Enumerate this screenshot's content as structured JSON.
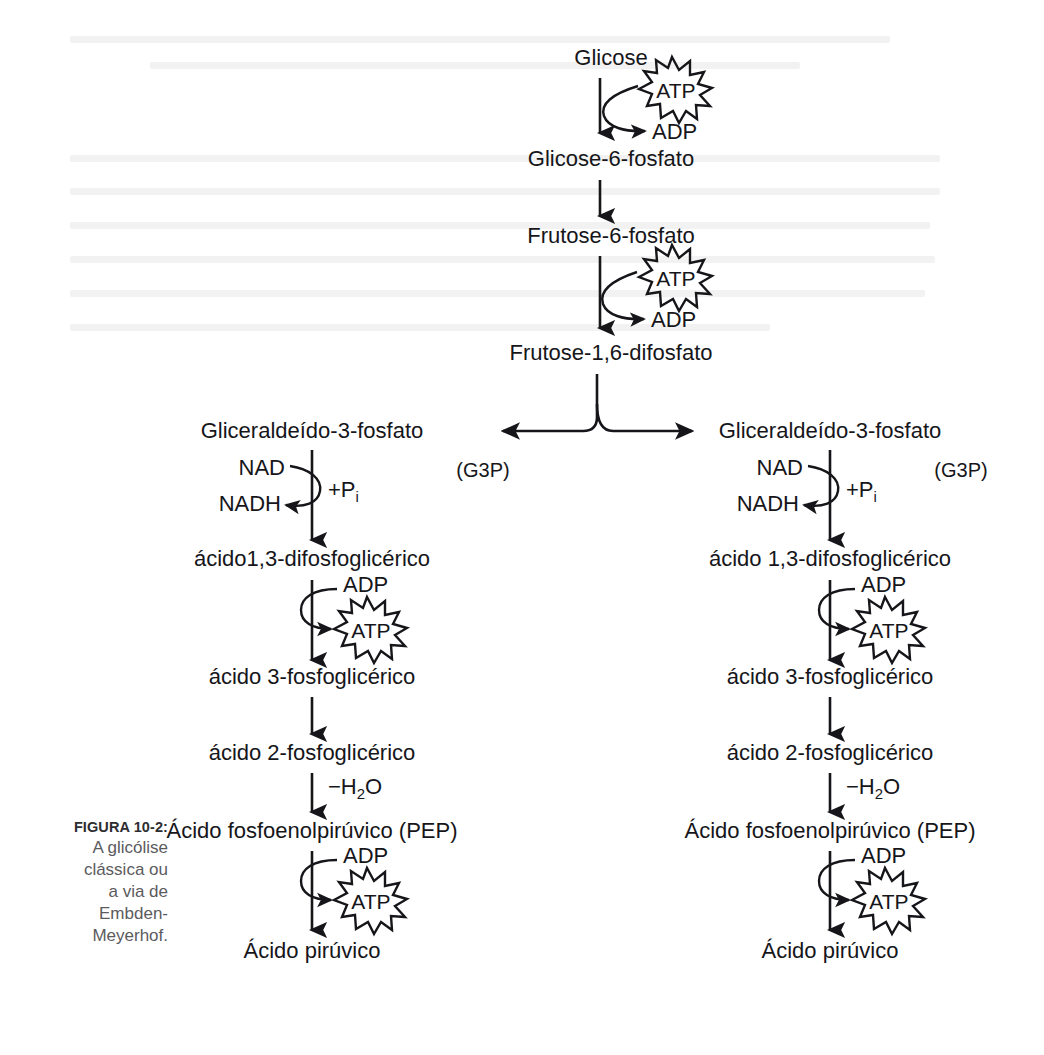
{
  "figure": {
    "caption_label": "FIGURA 10-2:",
    "caption_text": "A glicólise clássica ou a via de Embden-Meyerhof.",
    "caption_lines": [
      "A glicólise",
      "clássica ou",
      "a via de",
      "Embden-",
      "Meyerhof."
    ],
    "ink_color": "#16161a",
    "caption_color": "#5b5b5e",
    "background_color": "#ffffff"
  },
  "trunk": {
    "nodes": [
      {
        "id": "glicose",
        "label": "Glicose"
      },
      {
        "id": "glicose6p",
        "label": "Glicose-6-fosfato"
      },
      {
        "id": "frutose6p",
        "label": "Frutose-6-fosfato"
      },
      {
        "id": "frutose16dp",
        "label": "Frutose-1,6-difosfato"
      }
    ],
    "cofactor_steps": [
      {
        "from": "glicose",
        "to": "glicose6p",
        "input": "ATP",
        "output": "ADP",
        "input_shape": "starburst"
      },
      {
        "from": "frutose6p",
        "to": "frutose16dp",
        "input": "ATP",
        "output": "ADP",
        "input_shape": "starburst"
      }
    ]
  },
  "split": {
    "label": "fork-to-two-triose-branches",
    "left_arrow": "left",
    "right_arrow": "right"
  },
  "branches": [
    {
      "id": "left-branch",
      "aside_label": "(G3P)",
      "nodes": [
        {
          "id": "g3p-left",
          "label": "Gliceraldeído-3-fosfato"
        },
        {
          "id": "bpg-left",
          "label": "ácido1,3-difosfoglicérico"
        },
        {
          "id": "pg3-left",
          "label": "ácido 3-fosfoglicérico"
        },
        {
          "id": "pg2-left",
          "label": "ácido 2-fosfoglicérico"
        },
        {
          "id": "pep-left",
          "label": "Ácido fosfoenolpirúvico (PEP)"
        },
        {
          "id": "pyr-left",
          "label": "Ácido pirúvico"
        }
      ],
      "steps": [
        {
          "type": "redox",
          "input": "NAD",
          "output": "NADH",
          "side_note": "+P",
          "side_note_sub": "i"
        },
        {
          "type": "phosphorylation",
          "input": "ADP",
          "output": "ATP",
          "output_shape": "starburst"
        },
        {
          "type": "plain"
        },
        {
          "type": "dehydration",
          "side_note": "−H",
          "side_note_sub": "2",
          "side_note_tail": "O"
        },
        {
          "type": "phosphorylation",
          "input": "ADP",
          "output": "ATP",
          "output_shape": "starburst"
        }
      ]
    },
    {
      "id": "right-branch",
      "aside_label": "(G3P)",
      "nodes": [
        {
          "id": "g3p-right",
          "label": "Gliceraldeído-3-fosfato"
        },
        {
          "id": "bpg-right",
          "label": "ácido 1,3-difosfoglicérico"
        },
        {
          "id": "pg3-right",
          "label": "ácido 3-fosfoglicérico"
        },
        {
          "id": "pg2-right",
          "label": "ácido 2-fosfoglicérico"
        },
        {
          "id": "pep-right",
          "label": "Ácido fosfoenolpirúvico (PEP)"
        },
        {
          "id": "pyr-right",
          "label": "Ácido pirúvico"
        }
      ],
      "steps": [
        {
          "type": "redox",
          "input": "NAD",
          "output": "NADH",
          "side_note": "+P",
          "side_note_sub": "i"
        },
        {
          "type": "phosphorylation",
          "input": "ADP",
          "output": "ATP",
          "output_shape": "starburst"
        },
        {
          "type": "plain"
        },
        {
          "type": "dehydration",
          "side_note": "−H",
          "side_note_sub": "2",
          "side_note_tail": "O"
        },
        {
          "type": "phosphorylation",
          "input": "ADP",
          "output": "ATP",
          "output_shape": "starburst"
        }
      ]
    }
  ]
}
